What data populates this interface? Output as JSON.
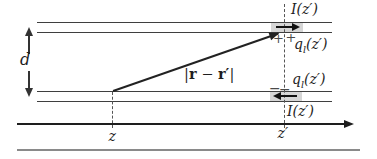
{
  "diagram": {
    "labels": {
      "separation": "d",
      "current_top": "I(z′)",
      "current_bottom": "I(z′)",
      "charge_symbol": "q",
      "charge_subscript": "l",
      "charge_argument": "(z′)",
      "vector_bar_left": "|",
      "vector_r": "r",
      "vector_minus": " − ",
      "vector_r_prime": "r′",
      "vector_bar_right": "|",
      "observation_coord": "z",
      "source_coord": "z′",
      "plus_sign": "+",
      "minus_sign": "−"
    },
    "colors": {
      "background": "#ffffff",
      "conductor_line": "#3f3f3f",
      "axis_line": "#1e1e1e",
      "baseline": "#8a8a8a",
      "shaded_segment": "#d6d6d6",
      "dashed_guide": "#555555",
      "arrow": "#222222",
      "text": "#1e1e1e",
      "charge_sign": "#4a4a4a"
    }
  }
}
